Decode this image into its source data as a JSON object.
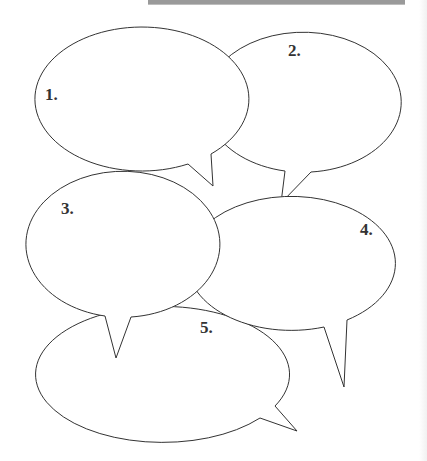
{
  "worksheet": {
    "type": "speech-bubble graphic organizer",
    "bubbles": [
      {
        "label": "1.",
        "text": ""
      },
      {
        "label": "2.",
        "text": ""
      },
      {
        "label": "3.",
        "text": ""
      },
      {
        "label": "4.",
        "text": ""
      },
      {
        "label": "5.",
        "text": ""
      }
    ]
  },
  "colors": {
    "outline": "#333333",
    "fill": "#ffffff",
    "top_bar": "#9a9a9a"
  }
}
